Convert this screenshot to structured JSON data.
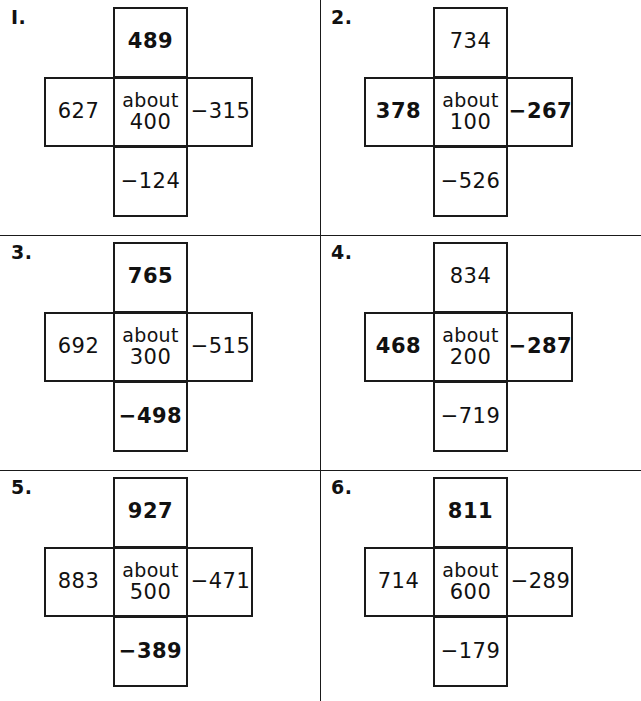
{
  "page": {
    "kind": "math-worksheet",
    "layout": "2-column by 3-row grid of cross puzzles",
    "ink_color": "#1a1a1a",
    "background_color": "#ffffff"
  },
  "problems": [
    {
      "number": "I.",
      "top": "489",
      "left": "627",
      "right": "−315",
      "bottom": "−124",
      "center_word": "about",
      "center_value": "400",
      "bold": {
        "top": true,
        "left": false,
        "right": false,
        "bottom": false,
        "center": false
      }
    },
    {
      "number": "2.",
      "top": "734",
      "left": "378",
      "right": "−267",
      "bottom": "−526",
      "center_word": "about",
      "center_value": "100",
      "bold": {
        "top": false,
        "left": true,
        "right": true,
        "bottom": false,
        "center": false
      }
    },
    {
      "number": "3.",
      "top": "765",
      "left": "692",
      "right": "−515",
      "bottom": "−498",
      "center_word": "about",
      "center_value": "300",
      "bold": {
        "top": true,
        "left": false,
        "right": false,
        "bottom": true,
        "center": false
      }
    },
    {
      "number": "4.",
      "top": "834",
      "left": "468",
      "right": "−287",
      "bottom": "−719",
      "center_word": "about",
      "center_value": "200",
      "bold": {
        "top": false,
        "left": true,
        "right": true,
        "bottom": false,
        "center": false
      }
    },
    {
      "number": "5.",
      "top": "927",
      "left": "883",
      "right": "−471",
      "bottom": "−389",
      "center_word": "about",
      "center_value": "500",
      "bold": {
        "top": true,
        "left": false,
        "right": false,
        "bottom": true,
        "center": false
      }
    },
    {
      "number": "6.",
      "top": "811",
      "left": "714",
      "right": "−289",
      "bottom": "−179",
      "center_word": "about",
      "center_value": "600",
      "bold": {
        "top": true,
        "left": false,
        "right": false,
        "bottom": false,
        "center": false
      }
    }
  ]
}
